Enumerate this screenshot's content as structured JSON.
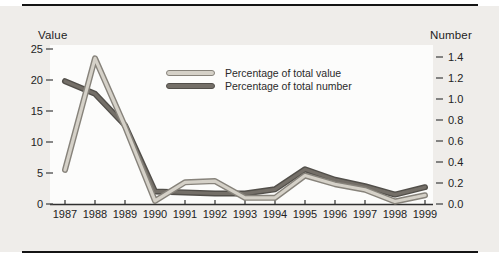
{
  "figure": {
    "panel_bg": "#efedea",
    "plot_bg": "#fcfcfb",
    "rule_color": "#141414",
    "text_color": "#232323",
    "axis_color": "#2f2f2f"
  },
  "chart_data": {
    "type": "line",
    "x": [
      1987,
      1988,
      1989,
      1990,
      1991,
      1992,
      1993,
      1994,
      1995,
      1996,
      1997,
      1998,
      1999
    ],
    "left_axis": {
      "label": "Value",
      "ticks": [
        0,
        5,
        10,
        15,
        20,
        25
      ],
      "range": [
        0,
        25
      ]
    },
    "right_axis": {
      "label": "Number",
      "ticks": [
        "0.0",
        "0.2",
        "0.4",
        "0.6",
        "0.8",
        "1.0",
        "1.2",
        "1.4"
      ],
      "range": [
        0,
        1.4
      ]
    },
    "series": [
      {
        "name": "Percentage of total value",
        "axis": "left",
        "color": "#d5d1c8",
        "edge_color": "#87837b",
        "values": [
          5.5,
          23.5,
          12.5,
          0.5,
          3.5,
          3.7,
          1.0,
          1.0,
          4.6,
          3.2,
          2.3,
          0.4,
          1.4
        ]
      },
      {
        "name": "Percentage of total number",
        "axis": "right",
        "color": "#746f68",
        "edge_color": "#524f4a",
        "values": [
          1.17,
          1.05,
          0.75,
          0.12,
          0.11,
          0.1,
          0.1,
          0.14,
          0.33,
          0.23,
          0.17,
          0.09,
          0.16
        ]
      }
    ],
    "legend_position": "inside-top-center",
    "grid": false
  }
}
